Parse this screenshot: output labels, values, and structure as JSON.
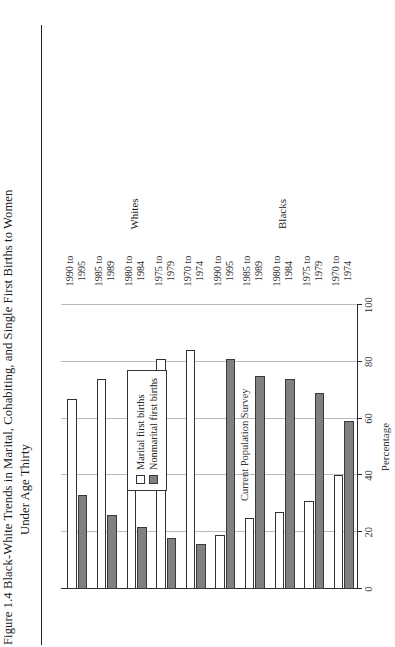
{
  "figure": {
    "title_line1": "Figure 1.4  Black-White Trends in Marital, Cohabiting, and Single First Births to Women",
    "title_line2": "Under Age Thirty",
    "source_note": "Current Population Survey"
  },
  "legend": {
    "position": "middle-left",
    "items": [
      {
        "label": "Marital first births",
        "swatch": "white-box",
        "color": "#ffffff"
      },
      {
        "label": "Nonmarital first births",
        "swatch": "gray-box",
        "color": "#808080"
      }
    ]
  },
  "axis": {
    "value_axis_title": "Percentage",
    "tick_labels": [
      "0",
      "20",
      "40",
      "60",
      "80",
      "100"
    ],
    "tick_values": [
      0,
      20,
      40,
      60,
      80,
      100
    ]
  },
  "groups": [
    {
      "name": "Whites"
    },
    {
      "name": "Blacks"
    }
  ],
  "categories": [
    {
      "line1": "1970 to",
      "line2": "1974"
    },
    {
      "line1": "1975 to",
      "line2": "1979"
    },
    {
      "line1": "1980 to",
      "line2": "1984"
    },
    {
      "line1": "1985 to",
      "line2": "1989"
    },
    {
      "line1": "1990 to",
      "line2": "1995"
    }
  ],
  "chart_data": {
    "type": "bar",
    "orientation": "horizontal",
    "title": "Figure 1.4  Black-White Trends in Marital, Cohabiting, and Single First Births to Women Under Age Thirty",
    "xlabel": "Percentage",
    "ylabel": "",
    "xlim": [
      0,
      100
    ],
    "grid": true,
    "grid_axis": "x",
    "legend_position": "middle-left",
    "group_labels": [
      "Whites",
      "Blacks"
    ],
    "categories": [
      "1970 to 1974",
      "1975 to 1979",
      "1980 to 1984",
      "1985 to 1989",
      "1990 to 1995"
    ],
    "panels": [
      {
        "group": "Whites",
        "series": [
          {
            "name": "Marital first births",
            "values": [
              84,
              81,
              77,
              74,
              67
            ]
          },
          {
            "name": "Nonmarital first births",
            "values": [
              16,
              18,
              22,
              26,
              33
            ]
          }
        ]
      },
      {
        "group": "Blacks",
        "series": [
          {
            "name": "Marital first births",
            "values": [
              40,
              31,
              27,
              25,
              19
            ]
          },
          {
            "name": "Nonmarital first births",
            "values": [
              59,
              69,
              74,
              75,
              81
            ]
          }
        ]
      }
    ],
    "notes": "Current Population Survey"
  }
}
